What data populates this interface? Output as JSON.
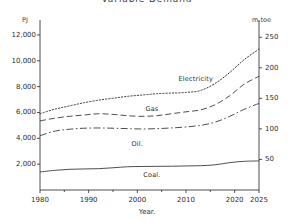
{
  "chart_data": {
    "type": "line",
    "title": "Variable Demand",
    "xlabel": "Year.",
    "ylabel": "PJ",
    "ylabel_right": "m.toe",
    "xlim": [
      1980,
      2025
    ],
    "ylim": [
      0,
      13000
    ],
    "ylim_right": [
      0,
      275
    ],
    "grid": false,
    "legend": "inline-labels",
    "x_ticks": [
      "1980",
      "1990",
      "2000",
      "2010",
      "2020",
      "2025"
    ],
    "x_tick_values": [
      1980,
      1990,
      2000,
      2010,
      2020,
      2025
    ],
    "y_ticks_left": [
      "2,000",
      "4,000",
      "6,000",
      "8,000",
      "10,000",
      "12,000"
    ],
    "y_tick_values_left": [
      2000,
      4000,
      6000,
      8000,
      10000,
      12000
    ],
    "y_ticks_right": [
      "50",
      "100",
      "150",
      "200",
      "250"
    ],
    "y_tick_values_right": [
      50,
      100,
      150,
      200,
      250
    ],
    "x": [
      1980,
      1983,
      1986,
      1989,
      1992,
      1995,
      1998,
      2001,
      2004,
      2007,
      2010,
      2013,
      2016,
      2019,
      2022,
      2025
    ],
    "series": [
      {
        "name": "Electricity",
        "style": "dotted",
        "color": "#3a3a3a",
        "label_x": 2012,
        "label_y": 8600,
        "values": [
          5900,
          6250,
          6500,
          6750,
          6950,
          7100,
          7250,
          7350,
          7450,
          7500,
          7550,
          7700,
          8250,
          9100,
          10100,
          10900
        ]
      },
      {
        "name": "Gas",
        "style": "dashed",
        "color": "#3a3a3a",
        "label_x": 2003,
        "label_y": 6250,
        "values": [
          5350,
          5550,
          5700,
          5800,
          5900,
          5850,
          5750,
          5700,
          5750,
          5900,
          6050,
          6200,
          6600,
          7300,
          8200,
          8800
        ]
      },
      {
        "name": "Oil.",
        "style": "dashdot",
        "color": "#3a3a3a",
        "label_x": 2000,
        "label_y": 3550,
        "values": [
          4200,
          4550,
          4700,
          4780,
          4800,
          4780,
          4750,
          4720,
          4750,
          4800,
          4880,
          5000,
          5250,
          5700,
          6250,
          6700
        ]
      },
      {
        "name": "Coal.",
        "style": "solid",
        "color": "#3a3a3a",
        "label_x": 2003,
        "label_y": 1150,
        "values": [
          1400,
          1520,
          1600,
          1630,
          1650,
          1720,
          1800,
          1820,
          1830,
          1840,
          1860,
          1880,
          1950,
          2120,
          2220,
          2250
        ]
      }
    ]
  }
}
